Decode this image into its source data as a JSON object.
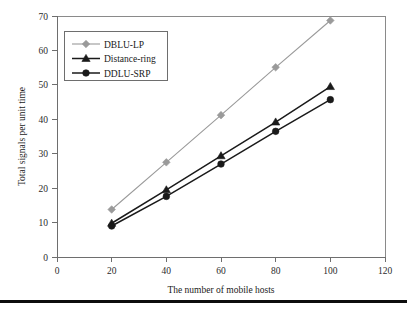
{
  "chart_data": {
    "type": "line",
    "title": "",
    "xlabel": "The number of mobile hosts",
    "ylabel": "Total signals per unit time",
    "x": [
      20,
      40,
      60,
      80,
      100
    ],
    "xlim": [
      0,
      120
    ],
    "ylim": [
      0,
      70
    ],
    "xticks": [
      0,
      20,
      40,
      60,
      80,
      100,
      120
    ],
    "yticks": [
      0,
      10,
      20,
      30,
      40,
      50,
      60,
      70
    ],
    "grid": false,
    "legend_position": "upper-left",
    "series": [
      {
        "name": "DBLU-LP",
        "values": [
          13.8,
          27.5,
          41.2,
          55.1,
          68.7
        ],
        "color": "#9a9a9a",
        "marker": "diamond"
      },
      {
        "name": "Distance-ring",
        "values": [
          9.8,
          19.5,
          29.4,
          39.2,
          49.5
        ],
        "color": "#1a1a1a",
        "marker": "triangle"
      },
      {
        "name": "DDLU-SRP",
        "values": [
          9.0,
          17.6,
          27.0,
          36.5,
          45.7
        ],
        "color": "#1a1a1a",
        "marker": "circle"
      }
    ]
  },
  "axis": {
    "x_tick_labels": [
      "0",
      "20",
      "40",
      "60",
      "80",
      "100",
      "120"
    ],
    "y_tick_labels": [
      "0",
      "10",
      "20",
      "30",
      "40",
      "50",
      "60",
      "70"
    ],
    "x_title": "The number of mobile hosts",
    "y_title": "Total signals per unit time"
  },
  "legend": {
    "items": [
      {
        "label": "DBLU-LP"
      },
      {
        "label": "Distance-ring"
      },
      {
        "label": "DDLU-SRP"
      }
    ]
  }
}
